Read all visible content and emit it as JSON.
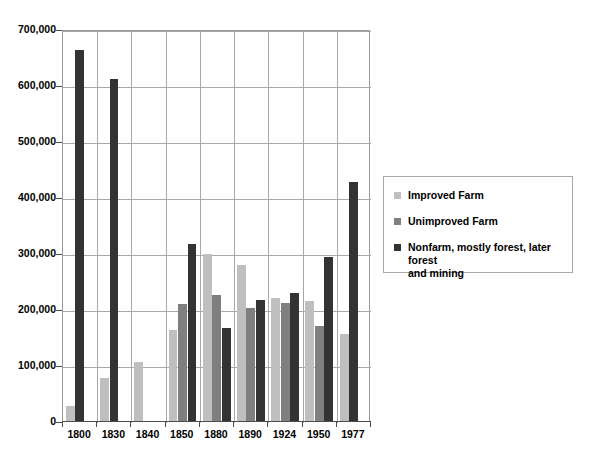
{
  "chart_data": {
    "type": "bar",
    "title": "",
    "subtitle": "",
    "xlabel": "",
    "ylabel": "",
    "categories": [
      "1800",
      "1830",
      "1840",
      "1850",
      "1880",
      "1890",
      "1924",
      "1950",
      "1977"
    ],
    "series": [
      {
        "name": "Improved Farm",
        "color": "#bfbfbf",
        "values": [
          28000,
          79000,
          107000,
          165000,
          300000,
          280000,
          221000,
          216000,
          157000
        ]
      },
      {
        "name": "Unimproved Farm",
        "color": "#7f7f7f",
        "values": [
          null,
          null,
          null,
          210000,
          227000,
          203000,
          212000,
          171000,
          null
        ]
      },
      {
        "name": "Nonfarm, mostly forest, later forest and mining",
        "color": "#333333",
        "values": [
          665000,
          613000,
          null,
          318000,
          167000,
          217000,
          231000,
          294000,
          429000
        ]
      }
    ],
    "ylim": [
      0,
      700000
    ],
    "ytick_values": [
      0,
      100000,
      200000,
      300000,
      400000,
      500000,
      600000,
      700000
    ],
    "ytick_labels": [
      "0",
      "100,000",
      "200,000",
      "300,000",
      "400,000",
      "500,000",
      "600,000",
      "700,000"
    ],
    "grid": true,
    "grid_axis": "both",
    "legend_position": "right",
    "legend_entries": [
      "Improved Farm",
      "Unimproved Farm",
      "Nonfarm, mostly forest, later forest and mining"
    ],
    "legend_entry_lines": [
      [
        "Improved Farm"
      ],
      [
        "Unimproved Farm"
      ],
      [
        "Nonfarm, mostly forest, later forest",
        "and mining"
      ]
    ]
  }
}
